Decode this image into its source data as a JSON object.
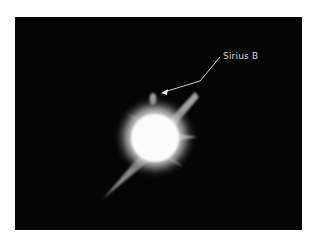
{
  "image": {
    "subject": "star-photograph",
    "annotation": {
      "label": "Sirius B"
    },
    "colors": {
      "background": "#050505",
      "star": "#ffffff",
      "annotation": "#d8d8d8"
    }
  }
}
